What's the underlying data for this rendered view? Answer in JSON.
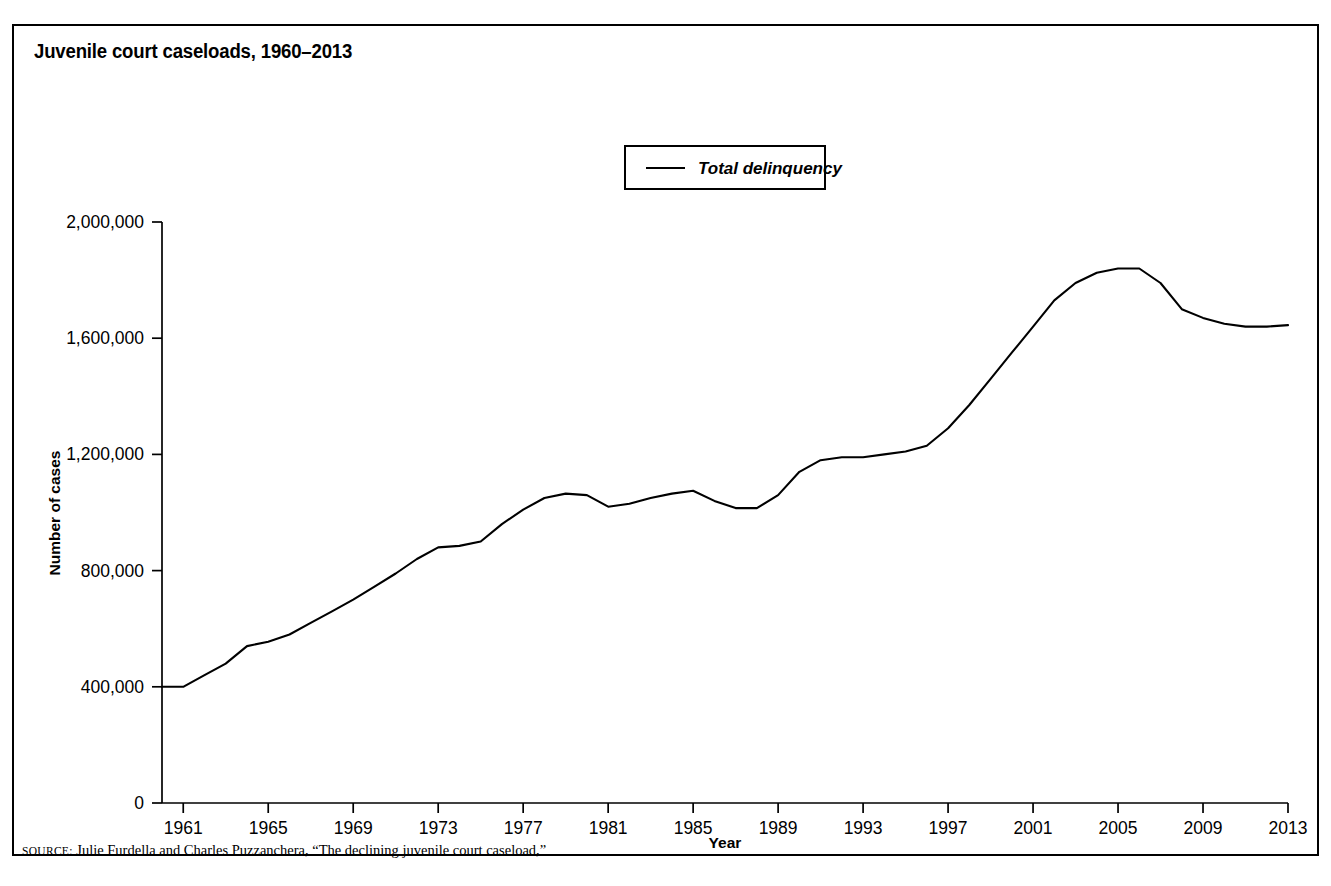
{
  "figure": {
    "title": "Juvenile court caseloads, 1960–2013",
    "source_prefix": "SOURCE:",
    "source_text": " Julie Furdella and Charles Puzzanchera, “The declining juvenile court caseload,”"
  },
  "legend": {
    "position": "top-center",
    "entries": [
      {
        "label": "Total delinquency",
        "marker": "line-swatch",
        "color": "#000000"
      }
    ]
  },
  "axes": {
    "x_title": "Year",
    "y_title": "Number of cases",
    "y_ticklabels": [
      "0",
      "400,000",
      "800,000",
      "1,200,000",
      "1,600,000",
      "2,000,000"
    ],
    "x_ticklabels": [
      "1961",
      "1965",
      "1969",
      "1973",
      "1977",
      "1981",
      "1985",
      "1989",
      "1993",
      "1997",
      "2001",
      "2005",
      "2009",
      "2013"
    ]
  },
  "chart_data": {
    "type": "line",
    "title": "Juvenile court caseloads, 1960–2013",
    "xlabel": "Year",
    "ylabel": "Number of cases",
    "xlim": [
      1960,
      2013
    ],
    "ylim": [
      0,
      2000000
    ],
    "ytick_values": [
      0,
      400000,
      800000,
      1200000,
      1600000,
      2000000
    ],
    "xtick_values": [
      1961,
      1965,
      1969,
      1973,
      1977,
      1981,
      1985,
      1989,
      1993,
      1997,
      2001,
      2005,
      2009,
      2013
    ],
    "grid": false,
    "legend_position": "upper center",
    "series": [
      {
        "name": "Total delinquency",
        "color": "#000000",
        "x": [
          1960,
          1961,
          1962,
          1963,
          1964,
          1965,
          1966,
          1967,
          1968,
          1969,
          1970,
          1971,
          1972,
          1973,
          1974,
          1975,
          1976,
          1977,
          1978,
          1979,
          1980,
          1981,
          1982,
          1983,
          1984,
          1985,
          1986,
          1987,
          1988,
          1989,
          1990,
          1991,
          1992,
          1993,
          1994,
          1995,
          1996,
          1997,
          1998,
          1999,
          2000,
          2001,
          2002,
          2003,
          2004,
          2005,
          2006,
          2007,
          2008,
          2009,
          2010,
          2011,
          2012,
          2013
        ],
        "values": [
          400000,
          400000,
          440000,
          480000,
          540000,
          555000,
          580000,
          620000,
          660000,
          700000,
          745000,
          790000,
          840000,
          880000,
          885000,
          900000,
          960000,
          1010000,
          1050000,
          1065000,
          1060000,
          1020000,
          1030000,
          1050000,
          1065000,
          1075000,
          1040000,
          1015000,
          1015000,
          1060000,
          1140000,
          1180000,
          1190000,
          1190000,
          1200000,
          1210000,
          1230000,
          1290000,
          1370000,
          1460000,
          1550000,
          1640000,
          1730000,
          1790000,
          1825000,
          1840000,
          1840000,
          1790000,
          1700000,
          1670000,
          1650000,
          1640000,
          1640000,
          1645000
        ]
      }
    ]
  }
}
